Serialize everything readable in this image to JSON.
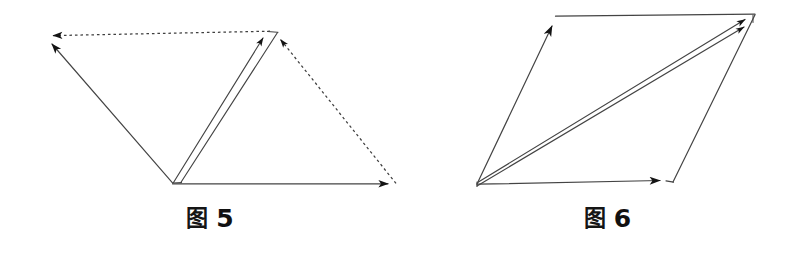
{
  "page": {
    "background_color": "#ffffff",
    "width": 795,
    "height": 264
  },
  "figures": [
    {
      "id": "fig5",
      "caption_word": "图",
      "caption_number": "5",
      "caption_full": "图 5",
      "stroke_color": "#3a3a3a",
      "arrow_color": "#111111",
      "dash_color": "#4a4a4a",
      "geometry": {
        "type": "parallelogram-with-diagonal",
        "points": {
          "top_left": [
            45,
            36
          ],
          "top_right": [
            270,
            31
          ],
          "bottom_left": [
            172,
            183
          ],
          "bottom_right": [
            397,
            184
          ]
        },
        "solid_edges": [
          {
            "name": "diagonal-up-left",
            "from": [
              172,
              183
            ],
            "to": [
              45,
              36
            ],
            "arrow_at": "to"
          },
          {
            "name": "left-slab-edge",
            "from": [
              173,
              183
            ],
            "to": [
              266,
              32
            ],
            "arrow_at": "to"
          },
          {
            "name": "right-slab-edge",
            "from": [
              181,
              182
            ],
            "to": [
              277,
              33
            ],
            "arrow_at": "none"
          },
          {
            "name": "bottom-edge",
            "from": [
              172,
              184
            ],
            "to": [
              397,
              184
            ],
            "arrow_at": "to"
          }
        ],
        "dashed_edges": [
          {
            "name": "top-edge",
            "from": [
              270,
              31
            ],
            "to": [
              46,
              36
            ],
            "arrow_at": "to"
          },
          {
            "name": "right-edge",
            "from": [
              396,
              184
            ],
            "to": [
              279,
              35
            ],
            "arrow_at": "to"
          }
        ]
      }
    },
    {
      "id": "fig6",
      "caption_word": "图",
      "caption_number": "6",
      "caption_full": "图 6",
      "stroke_color": "#3a3a3a",
      "arrow_color": "#111111",
      "geometry": {
        "type": "parallelogram-with-diagonal",
        "points": {
          "top_left": [
            556,
            16
          ],
          "top_right": [
            755,
            14
          ],
          "bottom_left": [
            477,
            184
          ],
          "bottom_right": [
            673,
            181
          ]
        },
        "solid_edges": [
          {
            "name": "left-edge",
            "from": [
              477,
              184
            ],
            "to": [
              556,
              17
            ],
            "arrow_at": "to"
          },
          {
            "name": "top-edge",
            "from": [
              556,
              16
            ],
            "to": [
              755,
              14
            ],
            "arrow_at": "none"
          },
          {
            "name": "right-edge",
            "from": [
              755,
              15
            ],
            "to": [
              673,
              182
            ],
            "arrow_at": "none"
          },
          {
            "name": "bottom-edge",
            "from": [
              477,
              184
            ],
            "to": [
              667,
              180
            ],
            "arrow_at": "to"
          },
          {
            "name": "bottom-right-stub",
            "from": [
              667,
              181
            ],
            "to": [
              673,
              182
            ],
            "arrow_at": "none"
          },
          {
            "name": "diagonal-upper",
            "from": [
              478,
              182
            ],
            "to": [
              753,
              15
            ],
            "arrow_at": "to"
          },
          {
            "name": "diagonal-lower",
            "from": [
              477,
              186
            ],
            "to": [
              752,
              22
            ],
            "arrow_at": "to"
          }
        ],
        "dashed_edges": []
      }
    }
  ]
}
